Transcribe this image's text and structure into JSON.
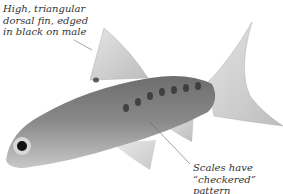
{
  "figure": {
    "annotations": [
      {
        "id": "dorsal-fin",
        "lines": [
          "High, triangular",
          "dorsal fin, edged",
          "in black on male"
        ]
      },
      {
        "id": "scales",
        "lines": [
          "Scales have",
          "“checkered”",
          "pattern"
        ]
      }
    ],
    "colors": {
      "background": "#ffffff",
      "text": "#333333",
      "leader_line": "#666666"
    }
  }
}
